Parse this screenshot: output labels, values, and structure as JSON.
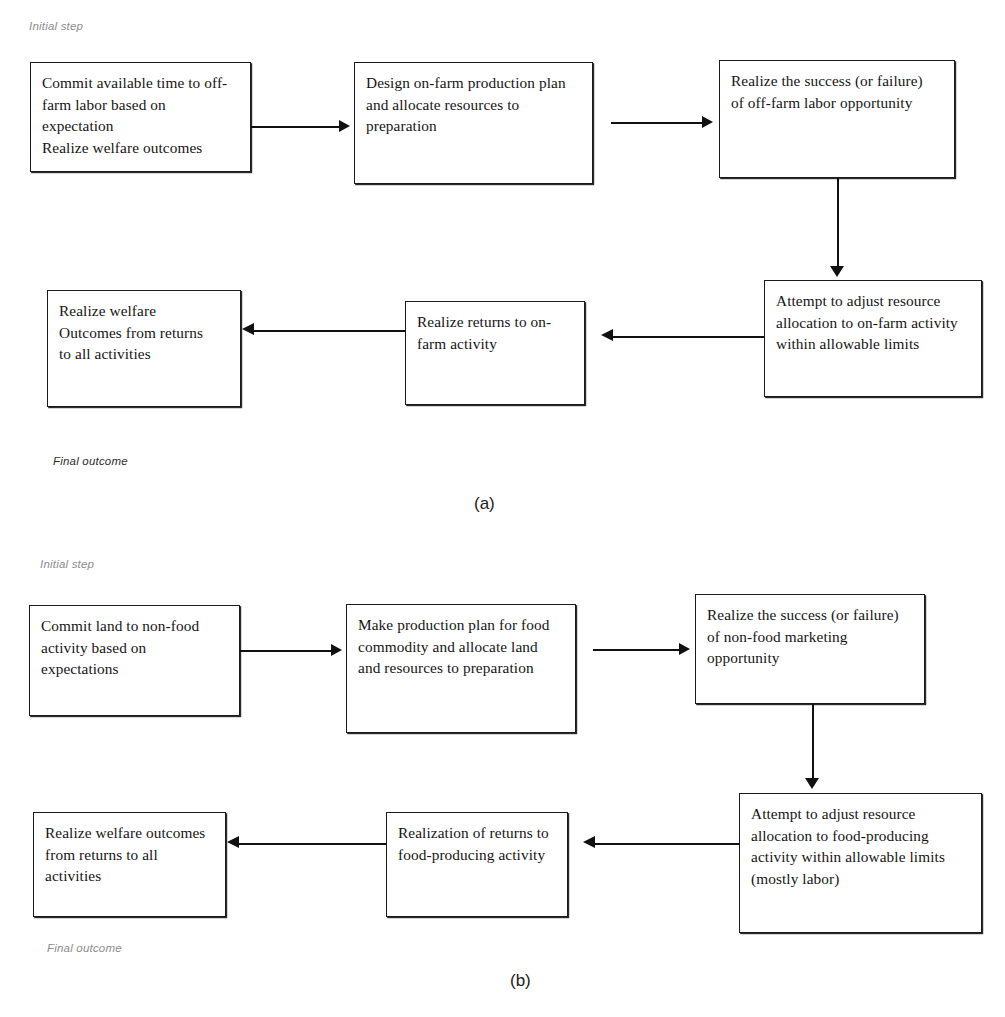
{
  "figure": {
    "panels": [
      {
        "id": "a",
        "caption": "(a)",
        "initial_label": "Initial step",
        "final_label": "Final outcome",
        "nodes": [
          {
            "name": "commit-time-off-farm",
            "lines": [
              "Commit available time to off-",
              "farm labor based on",
              "expectation",
              "Realize welfare outcomes"
            ]
          },
          {
            "name": "design-on-farm-plan",
            "lines": [
              "Design on-farm production plan",
              "and allocate resources to",
              "preparation"
            ]
          },
          {
            "name": "realize-off-farm-success",
            "lines": [
              "Realize the success (or failure)",
              "of off-farm labor opportunity"
            ]
          },
          {
            "name": "attempt-adjust-on-farm",
            "lines": [
              "Attempt to adjust resource",
              "allocation to on-farm activity",
              "within allowable limits"
            ]
          },
          {
            "name": "realize-returns-on-farm",
            "lines": [
              "Realize returns to on-",
              "farm activity"
            ]
          },
          {
            "name": "realize-welfare-outcomes",
            "lines": [
              "Realize welfare",
              "Outcomes from returns",
              "to all activities"
            ]
          }
        ]
      },
      {
        "id": "b",
        "caption": "(b)",
        "initial_label": "Initial step",
        "final_label": "Final outcome",
        "nodes": [
          {
            "name": "commit-land-non-food",
            "lines": [
              "Commit land to non-food",
              "activity based on",
              "expectations"
            ]
          },
          {
            "name": "make-food-production-plan",
            "lines": [
              "Make production plan for food",
              "commodity and allocate land",
              "and resources to preparation"
            ]
          },
          {
            "name": "realize-non-food-marketing-success",
            "lines": [
              "Realize the success (or failure)",
              "of non-food marketing",
              "opportunity"
            ]
          },
          {
            "name": "attempt-adjust-food-producing",
            "lines": [
              "Attempt to adjust resource",
              "allocation to food-producing",
              "activity within allowable limits",
              "(mostly labor)"
            ]
          },
          {
            "name": "realization-returns-food-producing",
            "lines": [
              "Realization of returns to",
              "food-producing activity"
            ]
          },
          {
            "name": "realize-welfare-outcomes",
            "lines": [
              "Realize welfare outcomes",
              "from returns to all",
              "activities"
            ]
          }
        ]
      }
    ]
  },
  "colors": {
    "ink": "#1b1b1b",
    "label_grey": "#8c8c8c",
    "page": "#ffffff"
  }
}
